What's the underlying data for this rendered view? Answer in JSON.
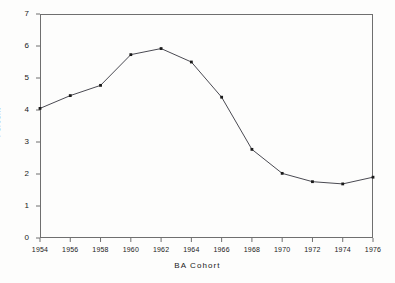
{
  "chart_data": {
    "type": "line",
    "title": "",
    "xlabel": "BA Cohort",
    "ylabel": "Percent",
    "x": [
      1954,
      1956,
      1958,
      1960,
      1962,
      1964,
      1966,
      1968,
      1970,
      1972,
      1974,
      1976
    ],
    "values": [
      4.05,
      4.45,
      4.77,
      5.73,
      5.92,
      5.5,
      4.4,
      2.77,
      2.02,
      1.76,
      1.69,
      1.9
    ],
    "series": [
      {
        "name": "Percent",
        "values": [
          4.05,
          4.45,
          4.77,
          5.73,
          5.92,
          5.5,
          4.4,
          2.77,
          2.02,
          1.76,
          1.69,
          1.9
        ]
      }
    ],
    "xlim": [
      1954,
      1976
    ],
    "ylim": [
      0,
      7
    ],
    "xticks": [
      "1954",
      "1956",
      "1958",
      "1960",
      "1962",
      "1964",
      "1966",
      "1968",
      "1970",
      "1972",
      "1974",
      "1976"
    ],
    "yticks": [
      "0",
      "1",
      "2",
      "3",
      "4",
      "5",
      "6",
      "7"
    ],
    "grid": false,
    "legend": "none",
    "marker": "square",
    "line_color": "#4a4a52",
    "marker_color": "#1a1a1a",
    "axis_color": "#6f6f6f",
    "background": "#fdfdfc"
  }
}
